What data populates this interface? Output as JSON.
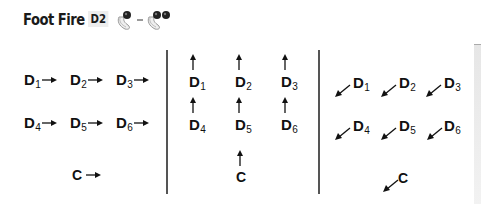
{
  "header": {
    "title": "Foot Fire",
    "badge": "D2",
    "icons": [
      "hand-one-ball-icon",
      "hand-two-balls-icon"
    ]
  },
  "panels": [
    {
      "direction": "right",
      "items": [
        {
          "letter": "D",
          "sub": "1"
        },
        {
          "letter": "D",
          "sub": "2"
        },
        {
          "letter": "D",
          "sub": "3"
        },
        {
          "letter": "D",
          "sub": "4"
        },
        {
          "letter": "D",
          "sub": "5"
        },
        {
          "letter": "D",
          "sub": "6"
        },
        {
          "letter": "C",
          "sub": ""
        }
      ]
    },
    {
      "direction": "up",
      "items": [
        {
          "letter": "D",
          "sub": "1"
        },
        {
          "letter": "D",
          "sub": "2"
        },
        {
          "letter": "D",
          "sub": "3"
        },
        {
          "letter": "D",
          "sub": "4"
        },
        {
          "letter": "D",
          "sub": "5"
        },
        {
          "letter": "D",
          "sub": "6"
        },
        {
          "letter": "C",
          "sub": ""
        }
      ]
    },
    {
      "direction": "down-left",
      "items": [
        {
          "letter": "D",
          "sub": "1"
        },
        {
          "letter": "D",
          "sub": "2"
        },
        {
          "letter": "D",
          "sub": "3"
        },
        {
          "letter": "D",
          "sub": "4"
        },
        {
          "letter": "D",
          "sub": "5"
        },
        {
          "letter": "D",
          "sub": "6"
        },
        {
          "letter": "C",
          "sub": ""
        }
      ]
    }
  ]
}
